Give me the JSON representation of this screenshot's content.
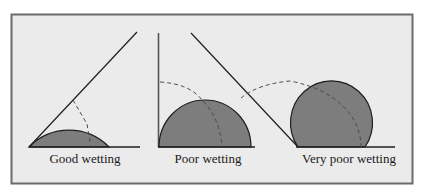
{
  "figure": {
    "colors": {
      "frame_border": "#6b6b6b",
      "frame_background": "#ebebeb",
      "droplet_fill": "#7d7d7d",
      "line": "#1e1e1e",
      "dashed": "#4a4a4a"
    },
    "panels": [
      {
        "id": "good",
        "label": "Good wetting"
      },
      {
        "id": "poor",
        "label": "Poor wetting"
      },
      {
        "id": "very-poor",
        "label": "Very poor wetting"
      }
    ]
  }
}
